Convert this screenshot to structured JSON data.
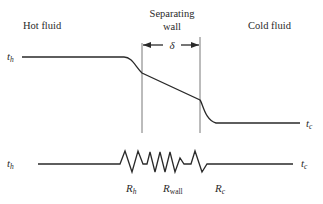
{
  "regions": {
    "hot": "Hot fluid",
    "wall_line1": "Separating",
    "wall_line2": "wall",
    "cold": "Cold fluid"
  },
  "dimension": {
    "symbol": "δ"
  },
  "temperatures": {
    "hot_symbol": "t",
    "hot_sub": "h",
    "cold_symbol": "t",
    "cold_sub": "c"
  },
  "resistances": [
    {
      "symbol": "R",
      "sub": "h"
    },
    {
      "symbol": "R",
      "sub": "wall"
    },
    {
      "symbol": "R",
      "sub": "c"
    }
  ],
  "colors": {
    "ink": "#2a2a2a",
    "background": "#ffffff"
  }
}
